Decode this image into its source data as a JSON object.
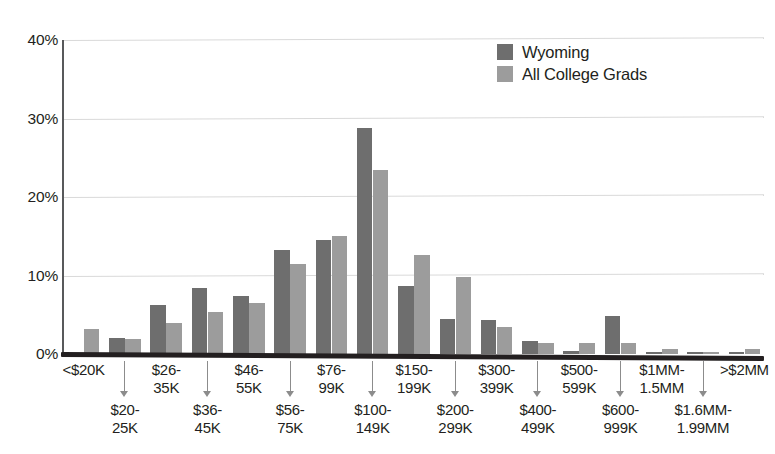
{
  "chart_data": {
    "type": "bar",
    "title": "",
    "xlabel": "",
    "ylabel": "",
    "ylim": [
      0,
      40
    ],
    "ytick_labels": [
      "0%",
      "10%",
      "20%",
      "30%",
      "40%"
    ],
    "ytick_values": [
      0,
      10,
      20,
      30,
      40
    ],
    "grid": true,
    "legend_position": "top-right",
    "categories": [
      "<$20K",
      "$20-\n25K",
      "$26-\n35K",
      "$36-\n45K",
      "$46-\n55K",
      "$56-\n75K",
      "$76-\n99K",
      "$100-\n149K",
      "$150-\n199K",
      "$200-\n299K",
      "$300-\n399K",
      "$400-\n499K",
      "$500-\n599K",
      "$600-\n999K",
      "$1MM-\n1.5MM",
      "$1.6MM-\n1.99MM",
      ">$2MM"
    ],
    "series": [
      {
        "name": "Wyoming",
        "color": "#6e6e6e",
        "values": [
          0,
          2.0,
          6.3,
          8.4,
          7.4,
          13.3,
          14.5,
          28.8,
          8.7,
          4.5,
          4.3,
          1.6,
          0.4,
          4.9,
          0.3,
          0.2,
          0.3
        ]
      },
      {
        "name": "All College Grads",
        "color": "#9c9c9c",
        "values": [
          3.2,
          1.9,
          3.9,
          5.3,
          6.5,
          11.5,
          15.0,
          23.4,
          12.6,
          9.8,
          3.5,
          1.4,
          1.4,
          1.4,
          0.6,
          0.3,
          0.6
        ]
      }
    ]
  },
  "legend": {
    "items": [
      {
        "label": "Wyoming",
        "swatch": "series-0"
      },
      {
        "label": "All College Grads",
        "swatch": "series-1"
      }
    ]
  },
  "axes": {
    "y_ticks": [
      {
        "label": "40%",
        "value": 40
      },
      {
        "label": "30%",
        "value": 30
      },
      {
        "label": "20%",
        "value": 20
      },
      {
        "label": "10%",
        "value": 10
      },
      {
        "label": "0%",
        "value": 0
      }
    ]
  }
}
